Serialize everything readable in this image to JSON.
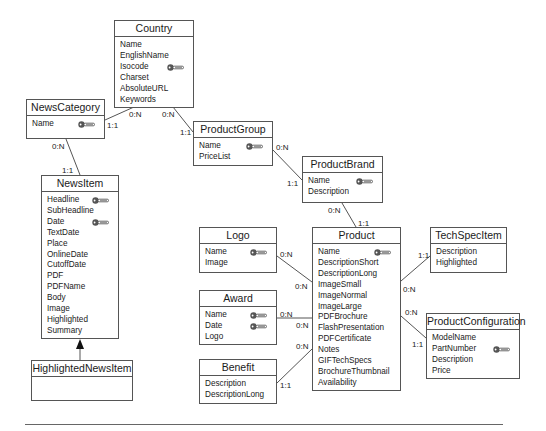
{
  "diagram": {
    "type": "entity-relationship",
    "entities": [
      {
        "id": "country",
        "name": "Country",
        "box": [
          114,
          20,
          80,
          88
        ],
        "attributes": [
          {
            "name": "Name"
          },
          {
            "name": "EnglishName"
          },
          {
            "name": "Isocode",
            "key": true
          },
          {
            "name": "Charset"
          },
          {
            "name": "AbsoluteURL"
          },
          {
            "name": "Keywords"
          }
        ]
      },
      {
        "id": "newscategory",
        "name": "NewsCategory",
        "box": [
          26,
          99,
          79,
          40
        ],
        "attributes": [
          {
            "name": "Name",
            "key": true
          }
        ]
      },
      {
        "id": "newsitem",
        "name": "NewsItem",
        "box": [
          41,
          175,
          78,
          164
        ],
        "attributes": [
          {
            "name": "Headline",
            "key": true
          },
          {
            "name": "SubHeadline"
          },
          {
            "name": "Date",
            "key": true
          },
          {
            "name": "TextDate"
          },
          {
            "name": "Place"
          },
          {
            "name": "OnlineDate"
          },
          {
            "name": "CutoffDate"
          },
          {
            "name": "PDF"
          },
          {
            "name": "PDFName"
          },
          {
            "name": "Body"
          },
          {
            "name": "Image"
          },
          {
            "name": "Highlighted"
          },
          {
            "name": "Summary"
          }
        ]
      },
      {
        "id": "highlightednewsitem",
        "name": "HighlightedNewsItem",
        "box": [
          31,
          360,
          102,
          41
        ],
        "attributes": []
      },
      {
        "id": "productgroup",
        "name": "ProductGroup",
        "box": [
          193,
          121,
          80,
          45
        ],
        "attributes": [
          {
            "name": "Name",
            "key": true
          },
          {
            "name": "PriceList"
          }
        ]
      },
      {
        "id": "productbrand",
        "name": "ProductBrand",
        "box": [
          302,
          156,
          81,
          47
        ],
        "attributes": [
          {
            "name": "Name",
            "key": true
          },
          {
            "name": "Description"
          }
        ]
      },
      {
        "id": "logo",
        "name": "Logo",
        "box": [
          199,
          227,
          78,
          46
        ],
        "attributes": [
          {
            "name": "Name",
            "key": true
          },
          {
            "name": "Image"
          }
        ]
      },
      {
        "id": "award",
        "name": "Award",
        "box": [
          199,
          290,
          78,
          55
        ],
        "attributes": [
          {
            "name": "Name",
            "key": true
          },
          {
            "name": "Date",
            "key": true
          },
          {
            "name": "Logo"
          }
        ]
      },
      {
        "id": "benefit",
        "name": "Benefit",
        "box": [
          199,
          359,
          78,
          45
        ],
        "attributes": [
          {
            "name": "Description"
          },
          {
            "name": "DescriptionLong"
          }
        ]
      },
      {
        "id": "product",
        "name": "Product",
        "box": [
          312,
          227,
          89,
          164
        ],
        "attributes": [
          {
            "name": "Name",
            "key": true
          },
          {
            "name": "DescriptionShort"
          },
          {
            "name": "DescriptionLong"
          },
          {
            "name": "ImageSmall"
          },
          {
            "name": "ImageNormal"
          },
          {
            "name": "ImageLarge"
          },
          {
            "name": "PDFBrochure"
          },
          {
            "name": "FlashPresentation"
          },
          {
            "name": "PDFCertificate"
          },
          {
            "name": "Notes"
          },
          {
            "name": "GIFTechSpecs"
          },
          {
            "name": "BrochureThumbnail"
          },
          {
            "name": "Availability"
          }
        ]
      },
      {
        "id": "techspecitem",
        "name": "TechSpecItem",
        "box": [
          430,
          227,
          77,
          46
        ],
        "attributes": [
          {
            "name": "Description"
          },
          {
            "name": "Highlighted"
          }
        ]
      },
      {
        "id": "productconfiguration",
        "name": "ProductConfiguration",
        "box": [
          426,
          313,
          94,
          66
        ],
        "attributes": [
          {
            "name": "ModelName"
          },
          {
            "name": "PartNumber",
            "key": true
          },
          {
            "name": "Description"
          },
          {
            "name": "Price"
          }
        ]
      }
    ],
    "relationships": [
      {
        "from": "country",
        "to": "newscategory",
        "line": [
          [
            134,
            107
          ],
          [
            105,
            120
          ]
        ],
        "cardinalities": [
          {
            "text": "0:N",
            "x": 129,
            "y": 110
          },
          {
            "text": "1:1",
            "x": 107,
            "y": 121
          }
        ]
      },
      {
        "from": "country",
        "to": "productgroup",
        "line": [
          [
            173,
            107
          ],
          [
            193,
            132
          ]
        ],
        "cardinalities": [
          {
            "text": "0:N",
            "x": 162,
            "y": 110
          },
          {
            "text": "1:1",
            "x": 180,
            "y": 128
          }
        ]
      },
      {
        "from": "newscategory",
        "to": "newsitem",
        "line": [
          [
            66,
            139
          ],
          [
            80,
            175
          ]
        ],
        "cardinalities": [
          {
            "text": "0:N",
            "x": 52,
            "y": 142
          },
          {
            "text": "1:1",
            "x": 62,
            "y": 166
          }
        ]
      },
      {
        "from": "productgroup",
        "to": "productbrand",
        "line": [
          [
            273,
            150
          ],
          [
            302,
            180
          ]
        ],
        "cardinalities": [
          {
            "text": "0:N",
            "x": 276,
            "y": 143
          },
          {
            "text": "1:1",
            "x": 287,
            "y": 179
          }
        ]
      },
      {
        "from": "productbrand",
        "to": "product",
        "line": [
          [
            342,
            203
          ],
          [
            356,
            227
          ]
        ],
        "cardinalities": [
          {
            "text": "0:N",
            "x": 328,
            "y": 206
          },
          {
            "text": "1:1",
            "x": 358,
            "y": 219
          }
        ]
      },
      {
        "from": "logo",
        "to": "product",
        "line": [
          [
            277,
            256
          ],
          [
            312,
            282
          ]
        ],
        "cardinalities": [
          {
            "text": "0:N",
            "x": 280,
            "y": 250
          },
          {
            "text": "0:N",
            "x": 295,
            "y": 282
          }
        ]
      },
      {
        "from": "award",
        "to": "product",
        "line": [
          [
            277,
            318
          ],
          [
            312,
            318
          ]
        ],
        "cardinalities": [
          {
            "text": "0:N",
            "x": 280,
            "y": 310
          },
          {
            "text": "0:N",
            "x": 296,
            "y": 321
          }
        ]
      },
      {
        "from": "benefit",
        "to": "product",
        "line": [
          [
            277,
            383
          ],
          [
            312,
            349
          ]
        ],
        "cardinalities": [
          {
            "text": "0:N",
            "x": 296,
            "y": 342
          },
          {
            "text": "1:1",
            "x": 280,
            "y": 381
          }
        ]
      },
      {
        "from": "product",
        "to": "techspecitem",
        "line": [
          [
            401,
            281
          ],
          [
            430,
            256
          ]
        ],
        "cardinalities": [
          {
            "text": "1:1",
            "x": 418,
            "y": 251
          },
          {
            "text": "0:N",
            "x": 403,
            "y": 285
          }
        ]
      },
      {
        "from": "product",
        "to": "productconfiguration",
        "line": [
          [
            401,
            316
          ],
          [
            426,
            338
          ]
        ],
        "cardinalities": [
          {
            "text": "0:N",
            "x": 405,
            "y": 308
          },
          {
            "text": "1:1",
            "x": 412,
            "y": 340
          }
        ]
      }
    ],
    "generalizations": [
      {
        "child": "highlightednewsitem",
        "parent": "newsitem",
        "line": [
          [
            80,
            360
          ],
          [
            80,
            339
          ]
        ]
      }
    ],
    "colors": {
      "stroke": "#555555",
      "text": "#1a1a1a",
      "key_icon": "#555555",
      "background": "#ffffff"
    }
  }
}
